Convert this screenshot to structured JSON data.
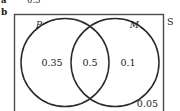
{
  "figure": {
    "previous_part": {
      "label": "a",
      "value": "0.3"
    },
    "part_label": "b",
    "universal_set_label": "S",
    "sets": [
      {
        "key": "left",
        "label": "P"
      },
      {
        "key": "right",
        "label": "M"
      }
    ],
    "regions": [
      {
        "key": "left_only",
        "label": "P only",
        "value": "0.35"
      },
      {
        "key": "intersection",
        "label": "P and M",
        "value": "0.5"
      },
      {
        "key": "right_only",
        "label": "M only",
        "value": "0.1"
      },
      {
        "key": "outside",
        "label": "neither P nor M",
        "value": "0.05"
      }
    ],
    "colors": {
      "stroke": "#2b2b2b",
      "rect_stroke": "#4a4a4a",
      "text": "#1a1a1a",
      "background": "#ffffff"
    }
  }
}
